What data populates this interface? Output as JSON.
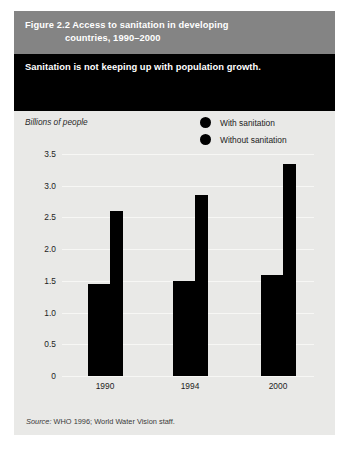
{
  "figure": {
    "number": "Figure 2.2",
    "title": "Access to sanitation in developing",
    "title_line2": "countries, 1990–2000",
    "subtitle": "Sanitation is not keeping up with population growth.",
    "source": "Source: WHO 1996; World Water Vision staff.",
    "source_word": "Source:",
    "source_rest": " WHO 1996; World Water Vision staff."
  },
  "colors": {
    "title_band": "#848484",
    "subtitle_band": "#000000",
    "panel": "#e9e9e7",
    "bar": "#000000",
    "gridline": "#f7f7f5",
    "page": "#ffffff"
  },
  "chart_data": {
    "type": "bar",
    "title": "Access to sanitation in developing countries, 1990–2000",
    "subtitle": "Sanitation is not keeping up with population growth.",
    "xlabel": "",
    "ylabel": "Billions of people",
    "categories": [
      "1990",
      "1994",
      "2000"
    ],
    "series": [
      {
        "name": "With sanitation",
        "values": [
          1.45,
          1.5,
          1.6
        ]
      },
      {
        "name": "Without sanitation",
        "values": [
          2.6,
          2.85,
          3.35
        ]
      }
    ],
    "ylim": [
      0,
      3.5
    ],
    "yticks": [
      "0",
      "0.5",
      "1.0",
      "1.5",
      "2.0",
      "2.5",
      "3.0",
      "3.5"
    ],
    "ytick_values": [
      0,
      0.5,
      1.0,
      1.5,
      2.0,
      2.5,
      3.0,
      3.5
    ],
    "grid": true,
    "legend": [
      "With sanitation",
      "Without sanitation"
    ],
    "legend_position": "top-right",
    "source": "Source: WHO 1996; World Water Vision staff."
  }
}
